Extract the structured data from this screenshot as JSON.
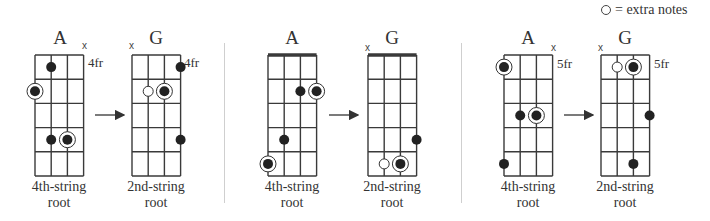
{
  "legend": {
    "symbol": "open-circle",
    "text": "= extra notes"
  },
  "chart_data": {
    "type": "diagram",
    "pairs": [
      {
        "from": {
          "chord": "A",
          "position_label": "4fr",
          "muted": [
            4
          ],
          "nut": false,
          "caption": [
            "4th-string",
            "root"
          ],
          "notes": [
            {
              "string": 2,
              "fret": 1,
              "type": "filled"
            },
            {
              "string": 1,
              "fret": 2,
              "type": "root"
            },
            {
              "string": 2,
              "fret": 4,
              "type": "filled"
            },
            {
              "string": 3,
              "fret": 4,
              "type": "root"
            }
          ]
        },
        "to": {
          "chord": "G",
          "position_label": "4fr",
          "muted": [
            1
          ],
          "nut": false,
          "caption": [
            "2nd-string",
            "root"
          ],
          "notes": [
            {
              "string": 4,
              "fret": 1,
              "type": "filled"
            },
            {
              "string": 2,
              "fret": 2,
              "type": "extra"
            },
            {
              "string": 3,
              "fret": 2,
              "type": "root"
            },
            {
              "string": 4,
              "fret": 4,
              "type": "filled"
            }
          ]
        }
      },
      {
        "from": {
          "chord": "A",
          "position_label": "",
          "muted": [],
          "nut": true,
          "caption": [
            "4th-string",
            "root"
          ],
          "notes": [
            {
              "string": 3,
              "fret": 2,
              "type": "filled"
            },
            {
              "string": 4,
              "fret": 2,
              "type": "root"
            },
            {
              "string": 2,
              "fret": 4,
              "type": "filled"
            },
            {
              "string": 1,
              "fret": 5,
              "type": "root"
            }
          ]
        },
        "to": {
          "chord": "G",
          "position_label": "",
          "muted": [
            1
          ],
          "nut": true,
          "caption": [
            "2nd-string",
            "root"
          ],
          "notes": [
            {
              "string": 4,
              "fret": 4,
              "type": "filled"
            },
            {
              "string": 2,
              "fret": 5,
              "type": "extra"
            },
            {
              "string": 3,
              "fret": 5,
              "type": "root"
            }
          ]
        }
      },
      {
        "from": {
          "chord": "A",
          "position_label": "5fr",
          "muted": [
            4
          ],
          "nut": false,
          "caption": [
            "4th-string",
            "root"
          ],
          "notes": [
            {
              "string": 1,
              "fret": 1,
              "type": "root"
            },
            {
              "string": 2,
              "fret": 3,
              "type": "filled"
            },
            {
              "string": 3,
              "fret": 3,
              "type": "root"
            },
            {
              "string": 1,
              "fret": 5,
              "type": "filled"
            }
          ]
        },
        "to": {
          "chord": "G",
          "position_label": "5fr",
          "muted": [
            1
          ],
          "nut": false,
          "caption": [
            "2nd-string",
            "root"
          ],
          "notes": [
            {
              "string": 2,
              "fret": 1,
              "type": "extra"
            },
            {
              "string": 3,
              "fret": 1,
              "type": "root"
            },
            {
              "string": 4,
              "fret": 3,
              "type": "filled"
            },
            {
              "string": 3,
              "fret": 5,
              "type": "filled"
            }
          ]
        }
      }
    ]
  },
  "diagrams": [
    {
      "title": "A",
      "x": 35,
      "fretlabel": "4fr",
      "cap1": "4th-string",
      "cap2": "root"
    },
    {
      "title": "G",
      "x": 132,
      "fretlabel": "4fr",
      "cap1": "2nd-string",
      "cap2": "root"
    },
    {
      "title": "A",
      "x": 268,
      "fretlabel": "",
      "cap1": "4th-string",
      "cap2": "root"
    },
    {
      "title": "G",
      "x": 368,
      "fretlabel": "",
      "cap1": "2nd-string",
      "cap2": "root"
    },
    {
      "title": "A",
      "x": 504,
      "fretlabel": "5fr",
      "cap1": "4th-string",
      "cap2": "root"
    },
    {
      "title": "G",
      "x": 601,
      "fretlabel": "5fr",
      "cap1": "2nd-string",
      "cap2": "root"
    }
  ],
  "mute_symbol": "x"
}
